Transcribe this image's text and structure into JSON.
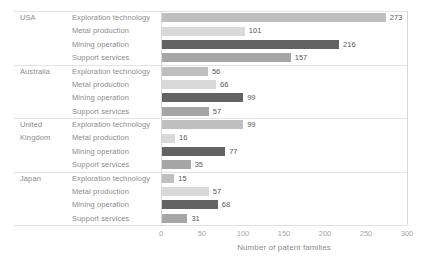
{
  "chart_data": {
    "type": "bar",
    "orientation": "horizontal",
    "title": "",
    "xlabel": "Number of patent families",
    "ylabel": "",
    "xlim": [
      0,
      300
    ],
    "xticks": [
      0,
      50,
      100,
      150,
      200,
      250,
      300
    ],
    "grid": false,
    "legend": "none",
    "categories_per_group": [
      "Exploration technology",
      "Metal production",
      "Mining operation",
      "Support services"
    ],
    "groups": [
      {
        "name": "USA",
        "rows": [
          {
            "label": "Exploration technology",
            "value": 273
          },
          {
            "label": "Metal production",
            "value": 101
          },
          {
            "label": "Mining operation",
            "value": 216
          },
          {
            "label": "Support services",
            "value": 157
          }
        ]
      },
      {
        "name": "Australia",
        "rows": [
          {
            "label": "Exploration technology",
            "value": 56
          },
          {
            "label": "Metal production",
            "value": 66
          },
          {
            "label": "Mining operation",
            "value": 99
          },
          {
            "label": "Support services",
            "value": 57
          }
        ]
      },
      {
        "name": "United Kingdom",
        "rows": [
          {
            "label": "Exploration technology",
            "value": 99
          },
          {
            "label": "Metal production",
            "value": 16
          },
          {
            "label": "Mining operation",
            "value": 77
          },
          {
            "label": "Support services",
            "value": 35
          }
        ]
      },
      {
        "name": "Japan",
        "rows": [
          {
            "label": "Exploration technology",
            "value": 15
          },
          {
            "label": "Metal production",
            "value": 57
          },
          {
            "label": "Mining operation",
            "value": 68
          },
          {
            "label": "Support services",
            "value": 31
          }
        ]
      }
    ],
    "series_colors": {
      "Exploration technology": "#bfbfbf",
      "Metal production": "#d9d9d9",
      "Mining operation": "#636363",
      "Support services": "#a6a6a6"
    },
    "axis_line_color": "#d9d9d9",
    "separator_line_color": "#e3e3e3",
    "background_color": "#ffffff"
  }
}
